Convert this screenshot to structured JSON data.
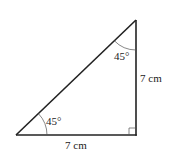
{
  "diagram": {
    "type": "right-isosceles-triangle",
    "vertices": {
      "bottom_left": [
        16,
        135
      ],
      "bottom_right": [
        136,
        135
      ],
      "top": [
        136,
        20
      ]
    },
    "angles": {
      "bottom_left": {
        "label": "45°"
      },
      "top": {
        "label": "45°"
      },
      "bottom_right": {
        "label": "",
        "marker": "right-angle-square"
      }
    },
    "sides": {
      "base": {
        "label": "7 cm"
      },
      "vertical": {
        "label": "7 cm"
      }
    },
    "colors": {
      "stroke": "#222222",
      "thin_stroke": "#555555",
      "background": "#ffffff"
    }
  }
}
